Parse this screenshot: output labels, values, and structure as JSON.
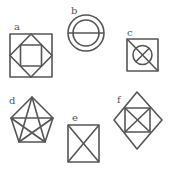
{
  "figure": {
    "stroke_color": "#555555",
    "background": "#ffffff",
    "panels": [
      {
        "label": "a",
        "description": "square containing a diamond containing a square"
      },
      {
        "label": "b",
        "description": "two concentric circles with a horizontal diameter"
      },
      {
        "label": "c",
        "description": "square with a diagonal and an inscribed circle containing an X"
      },
      {
        "label": "d",
        "description": "pentagon with an inscribed pentagram"
      },
      {
        "label": "e",
        "description": "square with both diagonals"
      },
      {
        "label": "f",
        "description": "diamond containing a square with both diagonals"
      }
    ]
  }
}
